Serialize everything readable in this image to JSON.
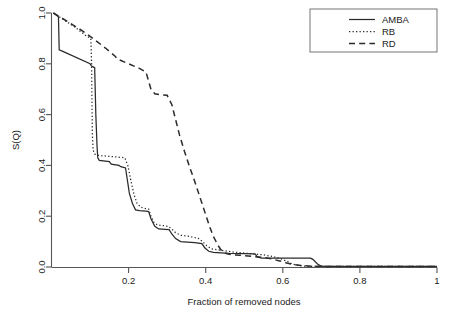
{
  "chart_data": {
    "type": "line",
    "title": "",
    "xlabel": "Fraction of removed nodes",
    "ylabel": "S(Q)",
    "xlim": [
      0,
      1
    ],
    "ylim": [
      0,
      1
    ],
    "xticks": [
      0.2,
      0.4,
      0.6,
      0.8,
      1
    ],
    "xticklabels": [
      "0.2",
      "0.4",
      "0.6",
      "0.8",
      "1"
    ],
    "yticks": [
      0.0,
      0.2,
      0.4,
      0.6,
      0.8,
      1.0
    ],
    "yticklabels": [
      "0.0",
      "0.2",
      "0.4",
      "0.6",
      "0.8",
      "1.0"
    ],
    "grid": false,
    "legend_position": "top-right",
    "series": [
      {
        "name": "AMBA",
        "style": "solid",
        "points": [
          [
            0.005,
            1.0
          ],
          [
            0.018,
            0.985
          ],
          [
            0.02,
            0.855
          ],
          [
            0.028,
            0.85
          ],
          [
            0.1,
            0.8
          ],
          [
            0.103,
            0.793
          ],
          [
            0.105,
            0.79
          ],
          [
            0.108,
            0.788
          ],
          [
            0.112,
            0.785
          ],
          [
            0.115,
            0.6
          ],
          [
            0.118,
            0.48
          ],
          [
            0.12,
            0.43
          ],
          [
            0.124,
            0.42
          ],
          [
            0.15,
            0.415
          ],
          [
            0.155,
            0.405
          ],
          [
            0.175,
            0.4
          ],
          [
            0.18,
            0.395
          ],
          [
            0.192,
            0.39
          ],
          [
            0.198,
            0.33
          ],
          [
            0.202,
            0.29
          ],
          [
            0.21,
            0.25
          ],
          [
            0.218,
            0.225
          ],
          [
            0.228,
            0.222
          ],
          [
            0.245,
            0.22
          ],
          [
            0.252,
            0.218
          ],
          [
            0.258,
            0.19
          ],
          [
            0.268,
            0.16
          ],
          [
            0.278,
            0.15
          ],
          [
            0.295,
            0.148
          ],
          [
            0.305,
            0.147
          ],
          [
            0.312,
            0.13
          ],
          [
            0.322,
            0.112
          ],
          [
            0.335,
            0.1
          ],
          [
            0.352,
            0.098
          ],
          [
            0.372,
            0.096
          ],
          [
            0.39,
            0.092
          ],
          [
            0.398,
            0.075
          ],
          [
            0.408,
            0.062
          ],
          [
            0.42,
            0.058
          ],
          [
            0.44,
            0.056
          ],
          [
            0.452,
            0.055
          ],
          [
            0.46,
            0.054
          ],
          [
            0.5,
            0.053
          ],
          [
            0.528,
            0.052
          ],
          [
            0.534,
            0.04
          ],
          [
            0.545,
            0.035
          ],
          [
            0.56,
            0.035
          ],
          [
            0.6,
            0.035
          ],
          [
            0.64,
            0.035
          ],
          [
            0.672,
            0.035
          ],
          [
            0.678,
            0.03
          ],
          [
            0.69,
            0.012
          ],
          [
            0.7,
            0.003
          ],
          [
            0.71,
            0.002
          ],
          [
            0.8,
            0.002
          ],
          [
            0.9,
            0.002
          ],
          [
            1.0,
            0.002
          ]
        ]
      },
      {
        "name": "RB",
        "style": "dotted",
        "points": [
          [
            0.005,
            1.0
          ],
          [
            0.03,
            0.975
          ],
          [
            0.06,
            0.945
          ],
          [
            0.09,
            0.91
          ],
          [
            0.102,
            0.9
          ],
          [
            0.104,
            0.8
          ],
          [
            0.105,
            0.65
          ],
          [
            0.106,
            0.52
          ],
          [
            0.108,
            0.46
          ],
          [
            0.112,
            0.445
          ],
          [
            0.118,
            0.44
          ],
          [
            0.13,
            0.438
          ],
          [
            0.148,
            0.436
          ],
          [
            0.16,
            0.434
          ],
          [
            0.178,
            0.432
          ],
          [
            0.19,
            0.43
          ],
          [
            0.198,
            0.4
          ],
          [
            0.206,
            0.34
          ],
          [
            0.214,
            0.285
          ],
          [
            0.222,
            0.25
          ],
          [
            0.232,
            0.235
          ],
          [
            0.244,
            0.23
          ],
          [
            0.252,
            0.228
          ],
          [
            0.258,
            0.2
          ],
          [
            0.266,
            0.175
          ],
          [
            0.276,
            0.165
          ],
          [
            0.29,
            0.163
          ],
          [
            0.302,
            0.16
          ],
          [
            0.312,
            0.15
          ],
          [
            0.322,
            0.135
          ],
          [
            0.335,
            0.125
          ],
          [
            0.35,
            0.122
          ],
          [
            0.366,
            0.118
          ],
          [
            0.382,
            0.112
          ],
          [
            0.392,
            0.1
          ],
          [
            0.402,
            0.085
          ],
          [
            0.414,
            0.072
          ],
          [
            0.43,
            0.068
          ],
          [
            0.448,
            0.064
          ],
          [
            0.466,
            0.06
          ],
          [
            0.492,
            0.056
          ],
          [
            0.52,
            0.052
          ],
          [
            0.548,
            0.048
          ],
          [
            0.572,
            0.042
          ],
          [
            0.596,
            0.032
          ],
          [
            0.612,
            0.022
          ],
          [
            0.624,
            0.012
          ],
          [
            0.64,
            0.006
          ],
          [
            0.66,
            0.003
          ],
          [
            0.7,
            0.002
          ],
          [
            0.8,
            0.002
          ],
          [
            1.0,
            0.002
          ]
        ]
      },
      {
        "name": "RD",
        "style": "dashed",
        "points": [
          [
            0.005,
            1.0
          ],
          [
            0.04,
            0.968
          ],
          [
            0.08,
            0.93
          ],
          [
            0.103,
            0.905
          ],
          [
            0.14,
            0.862
          ],
          [
            0.165,
            0.83
          ],
          [
            0.172,
            0.818
          ],
          [
            0.2,
            0.8
          ],
          [
            0.228,
            0.782
          ],
          [
            0.245,
            0.768
          ],
          [
            0.258,
            0.7
          ],
          [
            0.268,
            0.682
          ],
          [
            0.285,
            0.678
          ],
          [
            0.3,
            0.676
          ],
          [
            0.312,
            0.64
          ],
          [
            0.322,
            0.58
          ],
          [
            0.332,
            0.52
          ],
          [
            0.345,
            0.455
          ],
          [
            0.358,
            0.395
          ],
          [
            0.372,
            0.335
          ],
          [
            0.385,
            0.275
          ],
          [
            0.398,
            0.215
          ],
          [
            0.41,
            0.16
          ],
          [
            0.42,
            0.12
          ],
          [
            0.432,
            0.085
          ],
          [
            0.442,
            0.062
          ],
          [
            0.455,
            0.052
          ],
          [
            0.47,
            0.048
          ],
          [
            0.49,
            0.046
          ],
          [
            0.52,
            0.042
          ],
          [
            0.548,
            0.038
          ],
          [
            0.57,
            0.032
          ],
          [
            0.592,
            0.024
          ],
          [
            0.61,
            0.016
          ],
          [
            0.628,
            0.01
          ],
          [
            0.65,
            0.005
          ],
          [
            0.68,
            0.003
          ],
          [
            0.72,
            0.002
          ],
          [
            0.8,
            0.002
          ],
          [
            0.9,
            0.002
          ],
          [
            1.0,
            0.002
          ]
        ]
      }
    ]
  },
  "legend": {
    "entries": [
      {
        "label": "AMBA",
        "style": "solid"
      },
      {
        "label": "RB",
        "style": "dotted"
      },
      {
        "label": "RD",
        "style": "dashed"
      }
    ]
  },
  "axes": {
    "x_title": "Fraction of removed nodes",
    "y_title": "S(Q)",
    "x_tick_labels": [
      "0.2",
      "0.4",
      "0.6",
      "0.8",
      "1"
    ],
    "y_tick_labels": [
      "0.0",
      "0.2",
      "0.4",
      "0.6",
      "0.8",
      "1.0"
    ]
  }
}
